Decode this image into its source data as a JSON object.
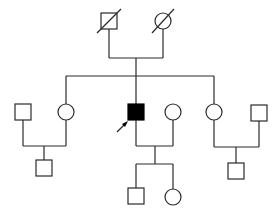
{
  "diagram": {
    "type": "pedigree",
    "colors": {
      "line": "#2a2a2a",
      "affected_fill": "#000000",
      "unaffected_fill": "#ffffff"
    },
    "generations": [
      {
        "label": "I",
        "individuals": [
          {
            "id": "I-1",
            "sex": "male",
            "status": "deceased",
            "affected": false
          },
          {
            "id": "I-2",
            "sex": "female",
            "status": "deceased",
            "affected": false
          }
        ]
      },
      {
        "label": "II",
        "individuals": [
          {
            "id": "II-1",
            "sex": "male",
            "status": "spouse",
            "affected": false
          },
          {
            "id": "II-2",
            "sex": "female",
            "status": "child of I",
            "affected": false
          },
          {
            "id": "II-3",
            "sex": "male",
            "status": "proband",
            "affected": true
          },
          {
            "id": "II-4",
            "sex": "female",
            "status": "spouse",
            "affected": false
          },
          {
            "id": "II-5",
            "sex": "female",
            "status": "child of I",
            "affected": false
          },
          {
            "id": "II-6",
            "sex": "male",
            "status": "spouse",
            "affected": false
          }
        ]
      },
      {
        "label": "III",
        "individuals": [
          {
            "id": "III-1",
            "sex": "male",
            "parents": [
              "II-1",
              "II-2"
            ],
            "affected": false
          },
          {
            "id": "III-2",
            "sex": "male",
            "parents": [
              "II-3",
              "II-4"
            ],
            "affected": false
          },
          {
            "id": "III-3",
            "sex": "female",
            "parents": [
              "II-3",
              "II-4"
            ],
            "affected": false
          },
          {
            "id": "III-4",
            "sex": "male",
            "parents": [
              "II-5",
              "II-6"
            ],
            "affected": false
          }
        ]
      }
    ],
    "proband_marker": "arrow-icon",
    "caption": ""
  }
}
